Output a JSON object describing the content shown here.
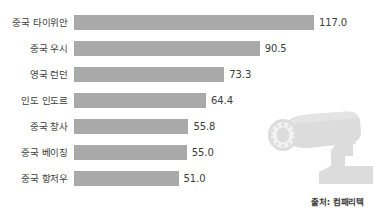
{
  "chart_data": {
    "type": "bar",
    "orientation": "horizontal",
    "title": "",
    "subtitle": "",
    "xlabel": "",
    "ylabel": "",
    "grid": false,
    "legend": false,
    "xlim": [
      0,
      117
    ],
    "categories": [
      "중국 타이위안",
      "중국 우시",
      "영국 런던",
      "인도 인도르",
      "중국 창사",
      "중국 베이징",
      "중국 항저우"
    ],
    "values": [
      117.0,
      90.5,
      73.3,
      64.4,
      55.8,
      55.0,
      51.0
    ],
    "value_labels": [
      "117.0",
      "90.5",
      "73.3",
      "64.4",
      "55.8",
      "55.0",
      "51.0"
    ],
    "bar_color": "#a9a9a9",
    "text_color": "#3d3d3d",
    "background_color": "#ffffff"
  },
  "rows": [
    {
      "label": "중국 타이위안",
      "value": 117.0,
      "value_label": "117.0"
    },
    {
      "label": "중국 우시",
      "value": 90.5,
      "value_label": "90.5"
    },
    {
      "label": "영국 런던",
      "value": 73.3,
      "value_label": "73.3"
    },
    {
      "label": "인도 인도르",
      "value": 64.4,
      "value_label": "64.4"
    },
    {
      "label": "중국 창사",
      "value": 55.8,
      "value_label": "55.8"
    },
    {
      "label": "중국 베이징",
      "value": 55.0,
      "value_label": "55.0"
    },
    {
      "label": "중국 항저우",
      "value": 51.0,
      "value_label": "51.0"
    }
  ],
  "source": {
    "text": "출처: 컴패리텍"
  },
  "illustration": {
    "icon": "cctv-camera-icon",
    "color": "#dcdcdc"
  }
}
